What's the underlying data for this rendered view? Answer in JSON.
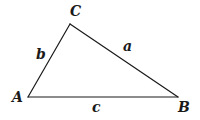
{
  "diagram": {
    "type": "triangle",
    "stroke_color": "#1a1a1a",
    "background": "#ffffff",
    "vertices": [
      {
        "name": "A",
        "x": 28,
        "y": 97,
        "label_x": 12,
        "label_y": 102
      },
      {
        "name": "B",
        "x": 178,
        "y": 97,
        "label_x": 178,
        "label_y": 112
      },
      {
        "name": "C",
        "x": 70,
        "y": 24,
        "label_x": 70,
        "label_y": 16
      }
    ],
    "sides": [
      {
        "name": "a",
        "from": "B",
        "to": "C",
        "label_x": 123,
        "label_y": 51
      },
      {
        "name": "b",
        "from": "A",
        "to": "C",
        "label_x": 36,
        "label_y": 59
      },
      {
        "name": "c",
        "from": "A",
        "to": "B",
        "label_x": 92,
        "label_y": 112
      }
    ]
  }
}
